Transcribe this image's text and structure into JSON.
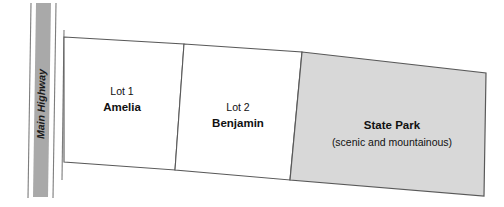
{
  "diagram": {
    "background_color": "#ffffff",
    "outline_color": "#595959",
    "highway": {
      "label": "Main Highway",
      "fill_color": "#a9a9a9",
      "orientation": "vertical-rotated",
      "reading_direction": "bottom-to-top"
    },
    "parcels": [
      {
        "id": "lot-1",
        "lot_label": "Lot 1",
        "owner_label": "Amelia",
        "fill_color": "#ffffff",
        "shaded": false
      },
      {
        "id": "lot-2",
        "lot_label": "Lot 2",
        "owner_label": "Benjamin",
        "fill_color": "#ffffff",
        "shaded": false
      },
      {
        "id": "state-park",
        "lot_label": "State Park",
        "owner_label": "(scenic and mountainous)",
        "fill_color": "#d8d8d8",
        "shaded": true
      }
    ]
  }
}
